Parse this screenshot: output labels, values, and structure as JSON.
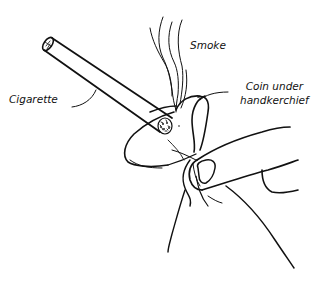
{
  "figure": {
    "labels": {
      "smoke": "Smoke",
      "cigarette": "Cigarette",
      "coin_line1": "Coin under",
      "coin_line2": "handkerchief"
    },
    "colors": {
      "ink": "#111111",
      "background": "#ffffff"
    }
  }
}
